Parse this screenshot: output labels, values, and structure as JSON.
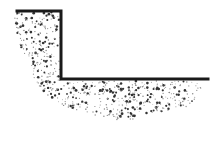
{
  "diagram": {
    "type": "cross-section",
    "colors": {
      "background": "#ffffff",
      "line": "#1a1a1a",
      "stipple_dark": "#333333",
      "stipple_light": "#8a8a8a"
    },
    "edge": {
      "points": [
        [
          17,
          11
        ],
        [
          61,
          11
        ],
        [
          61,
          79
        ],
        [
          208,
          79
        ]
      ],
      "stroke_width": 3
    },
    "soil_region": {
      "outline": [
        [
          17,
          11
        ],
        [
          61,
          11
        ],
        [
          61,
          79
        ],
        [
          208,
          79
        ],
        [
          200,
          95
        ],
        [
          185,
          108
        ],
        [
          160,
          112
        ],
        [
          140,
          118
        ],
        [
          120,
          122
        ],
        [
          100,
          116
        ],
        [
          80,
          112
        ],
        [
          60,
          104
        ],
        [
          45,
          94
        ],
        [
          35,
          80
        ],
        [
          30,
          65
        ],
        [
          22,
          50
        ],
        [
          15,
          35
        ],
        [
          14,
          20
        ]
      ],
      "dot_count": 650,
      "seed": 7
    }
  }
}
